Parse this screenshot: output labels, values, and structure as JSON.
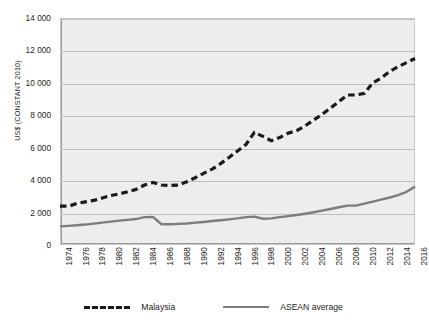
{
  "chart_data": {
    "type": "line",
    "title": "",
    "xlabel": "",
    "ylabel": "US$ (CONSTANT 2010)",
    "ylim": [
      0,
      14000
    ],
    "yticks": [
      0,
      2000,
      4000,
      6000,
      8000,
      10000,
      12000,
      14000
    ],
    "ytick_labels": [
      "0",
      "2 000",
      "4 000",
      "6 000",
      "8 000",
      "10 000",
      "12 000",
      "14 000"
    ],
    "xlim": [
      1974,
      2016
    ],
    "xtick_labels": [
      "1974",
      "1976",
      "1978",
      "1980",
      "1982",
      "1984",
      "1986",
      "1988",
      "1990",
      "1992",
      "1994",
      "1996",
      "1998",
      "2000",
      "2002",
      "2004",
      "2006",
      "2008",
      "2010",
      "2012",
      "2014",
      "2016"
    ],
    "grid": true,
    "legend_position": "bottom",
    "x": [
      1974,
      1975,
      1976,
      1977,
      1978,
      1979,
      1980,
      1981,
      1982,
      1983,
      1984,
      1985,
      1986,
      1987,
      1988,
      1989,
      1990,
      1991,
      1992,
      1993,
      1994,
      1995,
      1996,
      1997,
      1998,
      1999,
      2000,
      2001,
      2002,
      2003,
      2004,
      2005,
      2006,
      2007,
      2008,
      2009,
      2010,
      2011,
      2012,
      2013,
      2014,
      2015,
      2016
    ],
    "series": [
      {
        "name": "Malaysia",
        "style": "dashed",
        "color": "#1a1a1a",
        "values": [
          2400,
          2390,
          2560,
          2660,
          2750,
          2900,
          3050,
          3150,
          3280,
          3430,
          3700,
          3860,
          3700,
          3670,
          3700,
          3900,
          4150,
          4420,
          4680,
          5020,
          5400,
          5800,
          6200,
          6950,
          6700,
          6430,
          6630,
          6900,
          7050,
          7350,
          7700,
          8050,
          8450,
          8850,
          9250,
          9250,
          9350,
          10000,
          10300,
          10700,
          11000,
          11250,
          11500
        ]
      },
      {
        "name": "ASEAN average",
        "style": "solid",
        "color": "#7d7d7d",
        "values": [
          1150,
          1180,
          1220,
          1260,
          1320,
          1380,
          1440,
          1500,
          1550,
          1600,
          1720,
          1730,
          1280,
          1280,
          1300,
          1330,
          1380,
          1420,
          1480,
          1530,
          1580,
          1640,
          1720,
          1750,
          1620,
          1640,
          1720,
          1780,
          1850,
          1930,
          2020,
          2120,
          2220,
          2330,
          2430,
          2430,
          2550,
          2680,
          2800,
          2930,
          3080,
          3280,
          3600
        ]
      }
    ]
  },
  "legend": {
    "items": [
      {
        "label": "Malaysia",
        "style": "dashed"
      },
      {
        "label": "ASEAN average",
        "style": "solid"
      }
    ]
  }
}
